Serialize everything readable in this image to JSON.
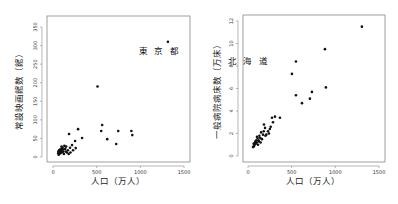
{
  "chart_data": [
    {
      "type": "scatter",
      "title": "",
      "xlabel": "人口（万人）",
      "ylabel": "常設映画館数（館）",
      "xlim": [
        0,
        1500
      ],
      "ylim": [
        0,
        350
      ],
      "xticks": [
        0,
        500,
        1000,
        1500
      ],
      "yticks": [
        0,
        50,
        100,
        150,
        200,
        250,
        300,
        350
      ],
      "grid": false,
      "annotations": [
        {
          "text": "東 京 都",
          "x": 1316,
          "y": 310
        }
      ],
      "points": [
        {
          "x": 1316,
          "y": 310,
          "label": "東京都"
        },
        {
          "x": 510,
          "y": 190
        },
        {
          "x": 563,
          "y": 86
        },
        {
          "x": 552,
          "y": 70
        },
        {
          "x": 747,
          "y": 70
        },
        {
          "x": 897,
          "y": 70
        },
        {
          "x": 908,
          "y": 59
        },
        {
          "x": 621,
          "y": 48
        },
        {
          "x": 724,
          "y": 35
        },
        {
          "x": 287,
          "y": 75
        },
        {
          "x": 184,
          "y": 62
        },
        {
          "x": 333,
          "y": 51
        },
        {
          "x": 253,
          "y": 43
        },
        {
          "x": 218,
          "y": 32
        },
        {
          "x": 195,
          "y": 25
        },
        {
          "x": 230,
          "y": 18
        },
        {
          "x": 260,
          "y": 24
        },
        {
          "x": 170,
          "y": 18
        },
        {
          "x": 150,
          "y": 28
        },
        {
          "x": 140,
          "y": 22
        },
        {
          "x": 130,
          "y": 30
        },
        {
          "x": 120,
          "y": 20
        },
        {
          "x": 115,
          "y": 14
        },
        {
          "x": 110,
          "y": 25
        },
        {
          "x": 105,
          "y": 18
        },
        {
          "x": 100,
          "y": 12
        },
        {
          "x": 95,
          "y": 22
        },
        {
          "x": 90,
          "y": 16
        },
        {
          "x": 85,
          "y": 10
        },
        {
          "x": 80,
          "y": 20
        },
        {
          "x": 75,
          "y": 14
        },
        {
          "x": 72,
          "y": 8
        },
        {
          "x": 70,
          "y": 18
        },
        {
          "x": 68,
          "y": 12
        },
        {
          "x": 65,
          "y": 6
        },
        {
          "x": 62,
          "y": 15
        },
        {
          "x": 60,
          "y": 10
        },
        {
          "x": 125,
          "y": 8
        },
        {
          "x": 160,
          "y": 12
        },
        {
          "x": 180,
          "y": 8
        },
        {
          "x": 145,
          "y": 15
        },
        {
          "x": 200,
          "y": 12
        },
        {
          "x": 98,
          "y": 28
        }
      ]
    },
    {
      "type": "scatter",
      "title": "",
      "xlabel": "人口（万人）",
      "ylabel": "一般病院病床数（万床）",
      "xlim": [
        0,
        1500
      ],
      "ylim": [
        0,
        12
      ],
      "xticks": [
        0,
        500,
        1000,
        1500
      ],
      "yticks": [
        0,
        2,
        4,
        6,
        8,
        10,
        12
      ],
      "grid": false,
      "annotations": [
        {
          "text": "北 海 道",
          "x": 549,
          "y": 8.4
        }
      ],
      "points": [
        {
          "x": 1304,
          "y": 11.5
        },
        {
          "x": 881,
          "y": 9.5
        },
        {
          "x": 549,
          "y": 8.4,
          "label": "北海道"
        },
        {
          "x": 503,
          "y": 7.3
        },
        {
          "x": 892,
          "y": 6.1
        },
        {
          "x": 732,
          "y": 5.7
        },
        {
          "x": 549,
          "y": 5.4
        },
        {
          "x": 709,
          "y": 5.1
        },
        {
          "x": 618,
          "y": 4.7
        },
        {
          "x": 366,
          "y": 3.4
        },
        {
          "x": 309,
          "y": 3.5
        },
        {
          "x": 275,
          "y": 3.4
        },
        {
          "x": 286,
          "y": 3.0
        },
        {
          "x": 183,
          "y": 2.8
        },
        {
          "x": 195,
          "y": 2.5
        },
        {
          "x": 229,
          "y": 2.2
        },
        {
          "x": 250,
          "y": 2.4
        },
        {
          "x": 210,
          "y": 1.9
        },
        {
          "x": 172,
          "y": 1.9
        },
        {
          "x": 150,
          "y": 2.1
        },
        {
          "x": 140,
          "y": 1.6
        },
        {
          "x": 130,
          "y": 1.8
        },
        {
          "x": 120,
          "y": 1.4
        },
        {
          "x": 110,
          "y": 1.6
        },
        {
          "x": 103,
          "y": 1.7
        },
        {
          "x": 100,
          "y": 1.2
        },
        {
          "x": 95,
          "y": 1.4
        },
        {
          "x": 90,
          "y": 1.1
        },
        {
          "x": 85,
          "y": 1.3
        },
        {
          "x": 80,
          "y": 1.2
        },
        {
          "x": 75,
          "y": 1.0
        },
        {
          "x": 70,
          "y": 0.9
        },
        {
          "x": 65,
          "y": 1.1
        },
        {
          "x": 60,
          "y": 0.8
        },
        {
          "x": 57,
          "y": 0.8
        },
        {
          "x": 160,
          "y": 1.5
        },
        {
          "x": 180,
          "y": 2.2
        },
        {
          "x": 200,
          "y": 1.8
        },
        {
          "x": 125,
          "y": 1.3
        },
        {
          "x": 115,
          "y": 1.0
        },
        {
          "x": 145,
          "y": 1.2
        },
        {
          "x": 240,
          "y": 2.0
        },
        {
          "x": 260,
          "y": 2.6
        }
      ]
    }
  ]
}
